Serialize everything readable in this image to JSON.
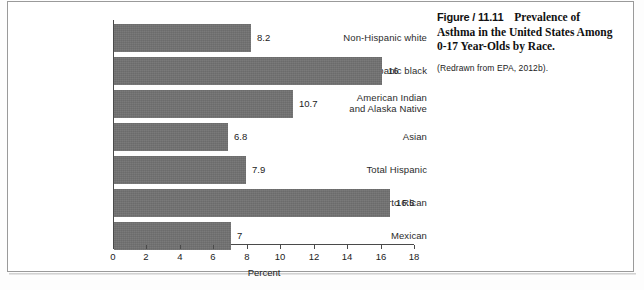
{
  "caption": {
    "figure_number": "Figure / 11.11",
    "title": "Prevalence of Asthma in the United States Among 0-17 Year-Olds by Race.",
    "source": "(Redrawn from EPA, 2012b)."
  },
  "chart_data": {
    "type": "bar",
    "orientation": "horizontal",
    "title": "",
    "categories": [
      "Non-Hispanic white",
      "Non-Hispanic black",
      "American Indian and Alaska Native",
      "Asian",
      "Total Hispanic",
      "Puerto Rican",
      "Mexican"
    ],
    "category_labels_multiline": [
      [
        "Non-Hispanic white"
      ],
      [
        "Non-Hispanic black"
      ],
      [
        "American Indian",
        "and Alaska Native"
      ],
      [
        "Asian"
      ],
      [
        "Total Hispanic"
      ],
      [
        "Puerto Rican"
      ],
      [
        "Mexican"
      ]
    ],
    "values": [
      8.2,
      16,
      10.7,
      6.8,
      7.9,
      16.5,
      7
    ],
    "value_labels": [
      "8.2",
      "16",
      "10.7",
      "6.8",
      "7.9",
      "16.5",
      "7"
    ],
    "xlabel": "Percent",
    "ylabel": "",
    "xlim": [
      0,
      18
    ],
    "xticks": [
      0,
      2,
      4,
      6,
      8,
      10,
      12,
      14,
      16,
      18
    ],
    "xtick_labels": [
      "0",
      "2",
      "4",
      "6",
      "8",
      "10",
      "12",
      "14",
      "16",
      "18"
    ],
    "grid": false,
    "legend": null,
    "bar_color": "#717171",
    "axis_color": "#4a4a4a",
    "text_color": "#222222"
  }
}
